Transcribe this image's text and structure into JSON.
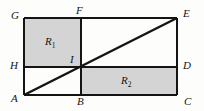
{
  "figure": {
    "kind": "geometry-diagram",
    "background_color": "#fdfdfc",
    "stroke_color": "#141414",
    "shade_color": "#d4d4d4",
    "vertices": [
      {
        "name": "G",
        "label": "G",
        "x": 24,
        "y": 18,
        "label_x": 11,
        "label_y": 10
      },
      {
        "name": "F",
        "label": "F",
        "x": 81,
        "y": 18,
        "label_x": 76,
        "label_y": 5
      },
      {
        "name": "E",
        "label": "E",
        "x": 177,
        "y": 18,
        "label_x": 183,
        "label_y": 8
      },
      {
        "name": "H",
        "label": "H",
        "x": 24,
        "y": 67,
        "label_x": 10,
        "label_y": 60
      },
      {
        "name": "I",
        "label": "I",
        "x": 81,
        "y": 67,
        "label_x": 70,
        "label_y": 54
      },
      {
        "name": "D",
        "label": "D",
        "x": 177,
        "y": 67,
        "label_x": 183,
        "label_y": 60
      },
      {
        "name": "A",
        "label": "A",
        "x": 24,
        "y": 95,
        "label_x": 11,
        "label_y": 93
      },
      {
        "name": "B",
        "label": "B",
        "x": 81,
        "y": 95,
        "label_x": 77,
        "label_y": 96
      },
      {
        "name": "C",
        "label": "C",
        "x": 177,
        "y": 95,
        "label_x": 184,
        "label_y": 96
      }
    ],
    "regions": [
      {
        "name": "region-r1",
        "label": "R",
        "subscript": "1",
        "x": 24,
        "y": 18,
        "width": 57,
        "height": 49,
        "shaded": true,
        "label_x": 45,
        "label_y": 36
      },
      {
        "name": "region-r2",
        "label": "R",
        "subscript": "2",
        "x": 81,
        "y": 67,
        "width": 96,
        "height": 28,
        "shaded": true,
        "label_x": 121,
        "label_y": 75
      }
    ],
    "segments": [
      {
        "name": "side-GE-top",
        "x1": 24,
        "y1": 18,
        "x2": 177,
        "y2": 18
      },
      {
        "name": "side-AC-bottom",
        "x1": 24,
        "y1": 95,
        "x2": 177,
        "y2": 95
      },
      {
        "name": "side-GA-left",
        "x1": 24,
        "y1": 18,
        "x2": 24,
        "y2": 95
      },
      {
        "name": "side-EC-right",
        "x1": 177,
        "y1": 18,
        "x2": 177,
        "y2": 95
      },
      {
        "name": "segment-FB-vertical",
        "x1": 81,
        "y1": 18,
        "x2": 81,
        "y2": 95
      },
      {
        "name": "segment-HD-horizontal",
        "x1": 24,
        "y1": 67,
        "x2": 177,
        "y2": 67
      },
      {
        "name": "diagonal-AE",
        "x1": 24,
        "y1": 95,
        "x2": 177,
        "y2": 18
      }
    ]
  }
}
